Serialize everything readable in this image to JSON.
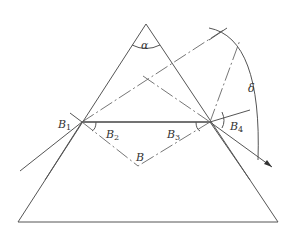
{
  "diagram": {
    "type": "prism-refraction",
    "labels": {
      "apex_angle": "α",
      "deviation": "δ",
      "b1": "B",
      "b1_sub": "1",
      "b2": "B",
      "b2_sub": "2",
      "b3": "B",
      "b3_sub": "3",
      "b4": "B",
      "b4_sub": "4",
      "b": "B"
    },
    "colors": {
      "line": "#555555",
      "text": "#333333",
      "background": "#ffffff"
    }
  }
}
